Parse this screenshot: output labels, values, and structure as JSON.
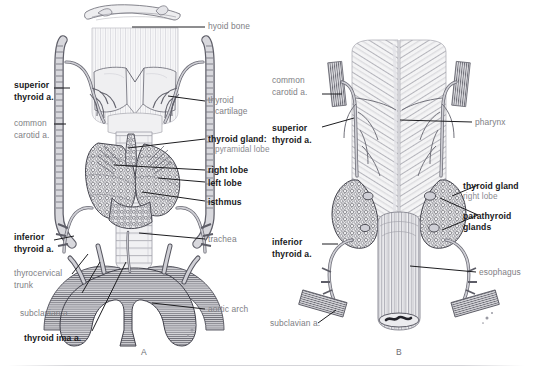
{
  "figure": {
    "background_color": "#ffffff",
    "bold_label_color": "#19191c",
    "plain_label_color": "#7e7e84",
    "leader_line_color": "#1d1d20"
  },
  "panels": [
    {
      "id": "A",
      "letter": "A",
      "view": "anterior",
      "labels": [
        {
          "id": "hyoid-bone",
          "text": "hyoid bone",
          "style": "plain",
          "side": "right"
        },
        {
          "id": "thyroid-cartilage",
          "text": "thyroid",
          "text2": "cartilage",
          "style": "plain",
          "side": "right"
        },
        {
          "id": "thyroid-gland",
          "text": "thyroid gland:",
          "style": "bold",
          "side": "right"
        },
        {
          "id": "pyramidal-lobe",
          "text": "pyramidal lobe",
          "style": "sub",
          "side": "right"
        },
        {
          "id": "right-lobe",
          "text": "right lobe",
          "style": "bold",
          "side": "right"
        },
        {
          "id": "left-lobe",
          "text": "left lobe",
          "style": "bold",
          "side": "right"
        },
        {
          "id": "isthmus",
          "text": "isthmus",
          "style": "bold",
          "side": "right"
        },
        {
          "id": "trachea",
          "text": "trachea",
          "style": "plain",
          "side": "right"
        },
        {
          "id": "aortic-arch",
          "text": "aortic arch",
          "style": "plain",
          "side": "right"
        },
        {
          "id": "superior-thyroid-a",
          "text": "superior",
          "text2": "thyroid a.",
          "style": "bold",
          "side": "left"
        },
        {
          "id": "common-carotid-a",
          "text": "common",
          "text2": "carotid a.",
          "style": "plain",
          "side": "left"
        },
        {
          "id": "inferior-thyroid-a",
          "text": "inferior",
          "text2": "thyroid a.",
          "style": "bold",
          "side": "left"
        },
        {
          "id": "thyrocervical-trunk",
          "text": "thyrocervical",
          "text2": "trunk",
          "style": "plain",
          "side": "left"
        },
        {
          "id": "subclavian-a",
          "text": "subclavian a.",
          "style": "plain",
          "side": "left"
        },
        {
          "id": "thyroid-ima-a",
          "text": "thyroid ima a.",
          "style": "bold",
          "side": "left"
        }
      ]
    },
    {
      "id": "B",
      "letter": "B",
      "view": "posterior",
      "labels": [
        {
          "id": "common-carotid-a-b",
          "text": "common",
          "text2": "carotid a.",
          "style": "plain",
          "side": "left"
        },
        {
          "id": "superior-thyroid-a-b",
          "text": "superior",
          "text2": "thyroid a.",
          "style": "bold",
          "side": "left"
        },
        {
          "id": "inferior-thyroid-a-b",
          "text": "inferior",
          "text2": "thyroid a.",
          "style": "bold",
          "side": "left"
        },
        {
          "id": "subclavian-a-b",
          "text": "subclavian a.",
          "style": "plain",
          "side": "left"
        },
        {
          "id": "pharynx",
          "text": "pharynx",
          "style": "plain",
          "side": "right"
        },
        {
          "id": "thyroid-gland-b",
          "text": "thyroid gland",
          "style": "bold",
          "side": "right"
        },
        {
          "id": "right-lobe-b",
          "text": "right lobe",
          "style": "sub",
          "side": "right"
        },
        {
          "id": "parathyroid-glands",
          "text": "parathyroid",
          "text2": "glands",
          "style": "bold",
          "side": "right"
        },
        {
          "id": "esophagus",
          "text": "esophagus",
          "style": "plain",
          "side": "right"
        }
      ]
    }
  ]
}
